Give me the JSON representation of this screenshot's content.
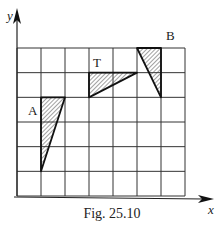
{
  "figure": {
    "caption": "Fig. 25.10",
    "x_axis_label": "x",
    "y_axis_label": "y",
    "grid": {
      "columns": 7,
      "rows": 6
    },
    "shapes": [
      {
        "label": "A",
        "vertices": [
          [
            1,
            4
          ],
          [
            2,
            4
          ],
          [
            1,
            1
          ]
        ],
        "fill": "hatched"
      },
      {
        "label": "T",
        "vertices": [
          [
            3,
            5
          ],
          [
            5,
            5
          ],
          [
            3,
            4
          ]
        ],
        "fill": "hatched"
      },
      {
        "label": "B",
        "vertices": [
          [
            5,
            6
          ],
          [
            6,
            6
          ],
          [
            6,
            4
          ]
        ],
        "fill": "hatched"
      }
    ]
  },
  "colors": {
    "line": "#222222",
    "background": "#ffffff"
  }
}
